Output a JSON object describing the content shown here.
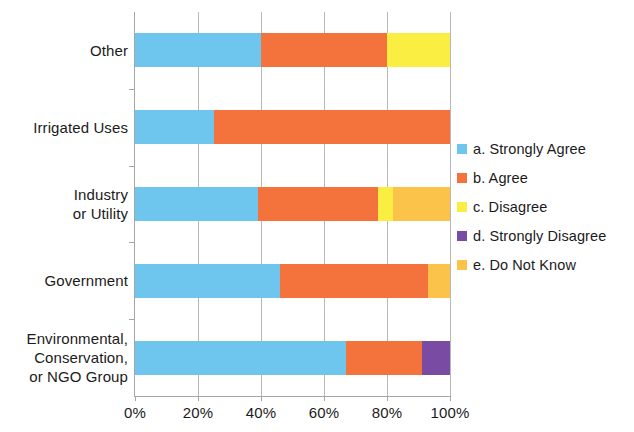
{
  "chart_data": {
    "type": "bar",
    "orientation": "horizontal",
    "stacked": true,
    "normalized_percent": true,
    "title": "",
    "xlabel": "",
    "ylabel": "",
    "xlim": [
      0,
      100
    ],
    "xticks": [
      "0%",
      "20%",
      "40%",
      "60%",
      "80%",
      "100%"
    ],
    "xtick_values": [
      0,
      20,
      40,
      60,
      80,
      100
    ],
    "grid": "vertical",
    "legend_position": "right",
    "categories": [
      "Other",
      "Irrigated Uses",
      "Industry\nor Utility",
      "Government",
      "Environmental,\nConservation,\nor NGO Group"
    ],
    "category_lines": [
      [
        "Other"
      ],
      [
        "Irrigated Uses"
      ],
      [
        "Industry",
        "or Utility"
      ],
      [
        "Government"
      ],
      [
        "Environmental,",
        "Conservation,",
        "or NGO Group"
      ]
    ],
    "series": [
      {
        "name": "a. Strongly Agree",
        "color": "#6EC6EF",
        "values": [
          40,
          25,
          39,
          46,
          67
        ]
      },
      {
        "name": "b. Agree",
        "color": "#F4723C",
        "values": [
          40,
          75,
          38,
          47,
          24
        ]
      },
      {
        "name": "c. Disagree",
        "color": "#FBEE43",
        "values": [
          20,
          0,
          5,
          0,
          0
        ]
      },
      {
        "name": "d. Strongly Disagree",
        "color": "#7A4BA3",
        "values": [
          0,
          0,
          0,
          0,
          9
        ]
      },
      {
        "name": "e. Do Not Know",
        "color": "#FBC349",
        "values": [
          0,
          0,
          18,
          7,
          0
        ]
      }
    ]
  },
  "legend": {
    "items": [
      {
        "label": "a. Strongly Agree",
        "color": "#6EC6EF"
      },
      {
        "label": "b. Agree",
        "color": "#F4723C"
      },
      {
        "label": "c. Disagree",
        "color": "#FBEE43"
      },
      {
        "label": "d. Strongly Disagree",
        "color": "#7A4BA3"
      },
      {
        "label": "e. Do Not Know",
        "color": "#FBC349"
      }
    ]
  },
  "axis": {
    "x_tick_labels": [
      "0%",
      "20%",
      "40%",
      "60%",
      "80%",
      "100%"
    ],
    "y_tick_labels": [
      "Other",
      "Irrigated Uses",
      "Industry or Utility",
      "Government",
      "Environmental, Conservation, or NGO Group"
    ]
  }
}
